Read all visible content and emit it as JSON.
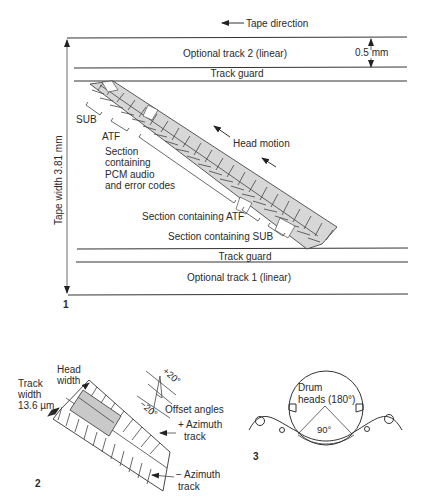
{
  "figure1": {
    "number": "1",
    "tape_direction": "Tape direction",
    "optional_track_2": "Optional track 2 (linear)",
    "optional_track_1": "Optional track 1 (linear)",
    "track_guard_top": "Track guard",
    "track_guard_bottom": "Track guard",
    "dimension_05": "0.5 mm",
    "tape_width": "Tape width 3.81 mm",
    "sub_label": "SUB",
    "atf_label": "ATF",
    "section_pcm": [
      "Section",
      "containing",
      "PCM audio",
      "and error codes"
    ],
    "section_atf": "Section containing ATF",
    "section_sub": "Section containing SUB",
    "head_motion": "Head motion"
  },
  "figure2": {
    "number": "2",
    "head_width": [
      "Head",
      "width"
    ],
    "track_width": [
      "Track",
      "width",
      "13.6 µm"
    ],
    "plus_angle": "+20°",
    "minus_angle": "−20°",
    "offset_angles": "Offset angles",
    "plus_azimuth": [
      "+ Azimuth",
      "track"
    ],
    "minus_azimuth": [
      "− Azimuth",
      "track"
    ]
  },
  "figure3": {
    "number": "3",
    "drum_heads": [
      "Drum",
      "heads (180°)"
    ],
    "wrap_angle": "90°"
  },
  "colors": {
    "line": "#333333",
    "hatch_fill": "#c9c9c9",
    "background": "#ffffff"
  }
}
